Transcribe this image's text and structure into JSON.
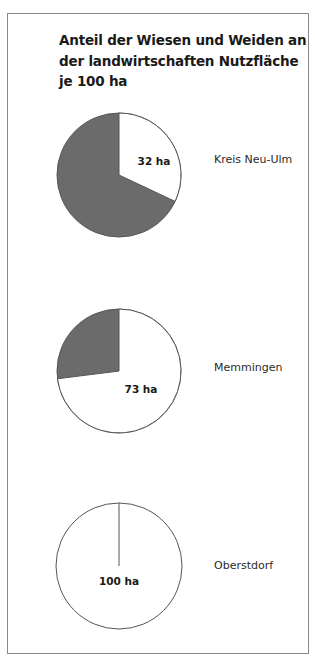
{
  "title_lines": [
    "Anteil der Wiesen und Weiden an",
    "der landwirtschaften Nutzfläche",
    "je 100 ha"
  ],
  "colors": {
    "meadow": "#ffffff",
    "other": "#6b6b6b",
    "outline": "#555555",
    "frame": "#8a8a8a"
  },
  "pies": [
    {
      "region": "Kreis Neu-Ulm",
      "value": 32,
      "label": "32 ha"
    },
    {
      "region": "Memmingen",
      "value": 73,
      "label": "73 ha"
    },
    {
      "region": "Oberstdorf",
      "value": 100,
      "label": "100 ha"
    }
  ],
  "chart_data": {
    "type": "pie",
    "title": "Anteil der Wiesen und Weiden an der landwirtschaften Nutzfläche je 100 ha",
    "unit": "ha per 100 ha",
    "charts": [
      {
        "name": "Kreis Neu-Ulm",
        "categories": [
          "Wiesen und Weiden",
          "Sonstige Nutzfläche"
        ],
        "values": [
          32,
          68
        ]
      },
      {
        "name": "Memmingen",
        "categories": [
          "Wiesen und Weiden",
          "Sonstige Nutzfläche"
        ],
        "values": [
          73,
          27
        ]
      },
      {
        "name": "Oberstdorf",
        "categories": [
          "Wiesen und Weiden",
          "Sonstige Nutzfläche"
        ],
        "values": [
          100,
          0
        ]
      }
    ],
    "annotations": [
      "32 ha",
      "73 ha",
      "100 ha"
    ],
    "legend": "none (labels to the right of each pie)"
  }
}
